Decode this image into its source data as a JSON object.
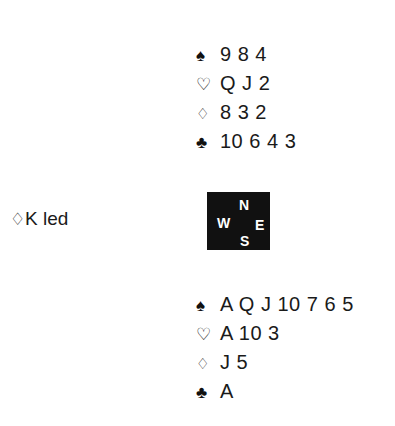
{
  "suit_glyphs": {
    "spades": "♠",
    "hearts": "♡",
    "diamonds": "♢",
    "clubs": "♣"
  },
  "north": {
    "label": "North hand",
    "suits": [
      {
        "name": "spades",
        "symbol": "♠",
        "cards": "9 8 4"
      },
      {
        "name": "hearts",
        "symbol": "♡",
        "cards": "Q J 2"
      },
      {
        "name": "diamonds",
        "symbol": "♢",
        "cards": "8 3 2"
      },
      {
        "name": "clubs",
        "symbol": "♣",
        "cards": "10 6 4 3"
      }
    ]
  },
  "south": {
    "label": "South hand",
    "suits": [
      {
        "name": "spades",
        "symbol": "♠",
        "cards": "A Q J 10 7 6 5"
      },
      {
        "name": "hearts",
        "symbol": "♡",
        "cards": "A 10 3"
      },
      {
        "name": "diamonds",
        "symbol": "♢",
        "cards": "J 5"
      },
      {
        "name": "clubs",
        "symbol": "♣",
        "cards": "A"
      }
    ]
  },
  "compass": {
    "north": "N",
    "west": "W",
    "east": "E",
    "south": "S",
    "background_color": "#111111",
    "text_color": "#ffffff"
  },
  "opening_lead": {
    "suit_symbol": "♢",
    "text": "K led"
  }
}
